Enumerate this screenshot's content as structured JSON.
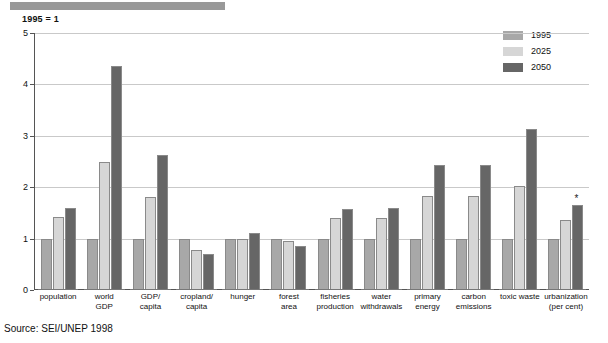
{
  "header": {
    "unit_caption": "1995 = 1"
  },
  "legend": {
    "position": "top-right",
    "entries": [
      {
        "label": "1995",
        "color": "#a8a8a8"
      },
      {
        "label": "2025",
        "color": "#d6d6d6"
      },
      {
        "label": "2050",
        "color": "#666666"
      }
    ]
  },
  "source": {
    "text": "Source: SEI/UNEP 1998"
  },
  "annotations": {
    "urbanization_marker": "*"
  },
  "chart_data": {
    "type": "bar",
    "title": "",
    "subtitle": "1995 = 1",
    "xlabel": "",
    "ylabel": "",
    "ylim": [
      0,
      5
    ],
    "yticks": [
      0,
      1,
      2,
      3,
      4,
      5
    ],
    "grid": true,
    "legend_position": "top-right",
    "categories": [
      "population",
      "world GDP",
      "GDP/ capita",
      "cropland/ capita",
      "hunger",
      "forest area",
      "fisheries production",
      "water withdrawals",
      "primary energy",
      "carbon emissions",
      "toxic waste",
      "urbanization (per cent)"
    ],
    "category_lines": [
      [
        "population"
      ],
      [
        "world",
        "GDP"
      ],
      [
        "GDP/",
        "capita"
      ],
      [
        "cropland/",
        "capita"
      ],
      [
        "hunger"
      ],
      [
        "forest",
        "area"
      ],
      [
        "fisheries",
        "production"
      ],
      [
        "water",
        "withdrawals"
      ],
      [
        "primary",
        "energy"
      ],
      [
        "carbon",
        "emissions"
      ],
      [
        "toxic waste"
      ],
      [
        "urbanization",
        "(per cent)"
      ]
    ],
    "series": [
      {
        "name": "1995",
        "color": "#a8a8a8",
        "values": [
          1.0,
          1.0,
          1.0,
          1.0,
          1.0,
          1.0,
          1.0,
          1.0,
          1.0,
          1.0,
          1.0,
          1.0
        ]
      },
      {
        "name": "2025",
        "color": "#d6d6d6",
        "values": [
          1.42,
          2.5,
          1.8,
          0.78,
          1.0,
          0.95,
          1.41,
          1.41,
          1.83,
          1.82,
          2.03,
          1.37
        ]
      },
      {
        "name": "2050",
        "color": "#666666",
        "values": [
          1.6,
          4.35,
          2.63,
          0.7,
          1.1,
          0.85,
          1.57,
          1.6,
          2.43,
          2.43,
          3.13,
          1.65
        ]
      }
    ]
  }
}
